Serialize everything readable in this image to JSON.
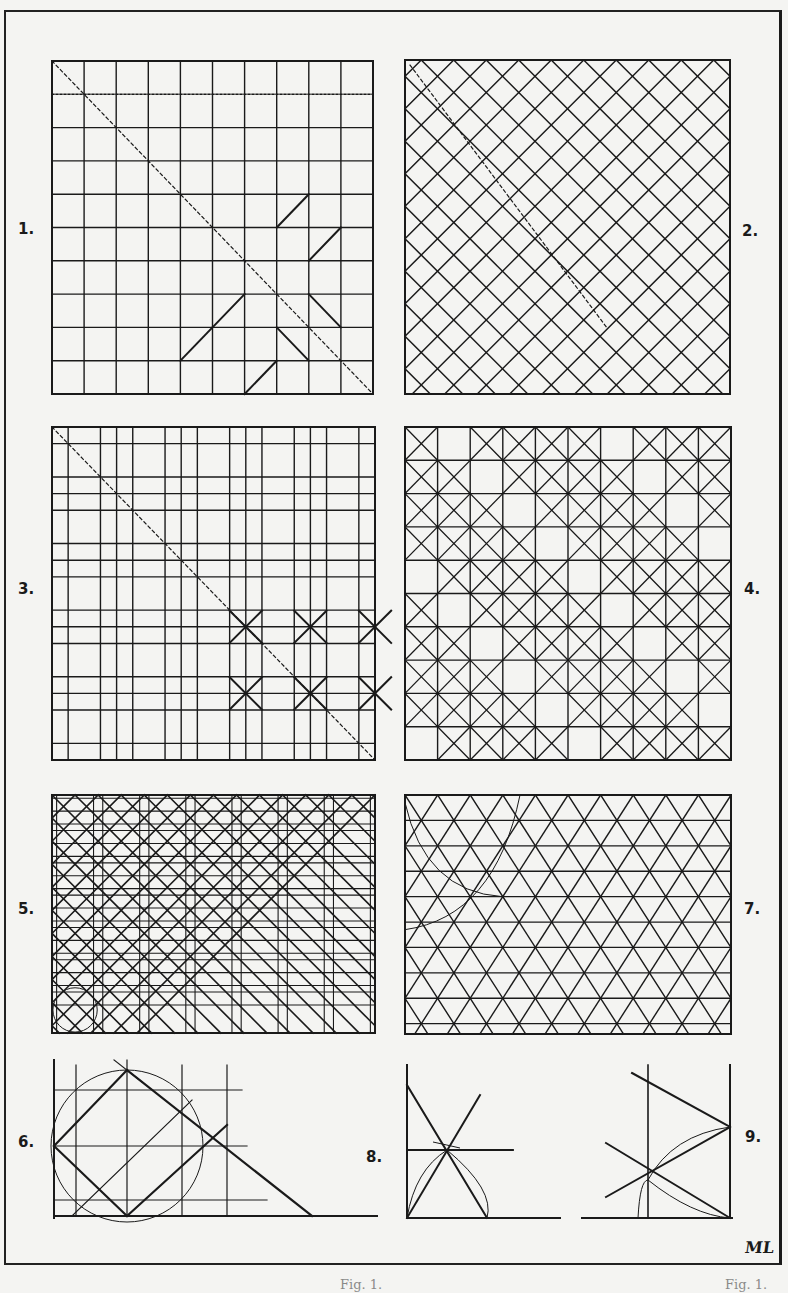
{
  "plate": {
    "monogram": "ML",
    "caption_fragments": [
      "Fig. 1.",
      "Fig. 1."
    ],
    "ink_color": "#1a1a1a",
    "paper_color": "#f4f4f2"
  },
  "figures": [
    {
      "id": 1,
      "label": "1.",
      "kind": "square-grid-diagonal",
      "box": [
        52,
        61,
        321,
        333
      ],
      "divisions": 10,
      "label_pos": [
        18,
        230
      ]
    },
    {
      "id": 2,
      "label": "2.",
      "kind": "diagonal-lattice",
      "box": [
        405,
        60,
        325,
        334
      ],
      "divisions": 10,
      "label_pos": [
        742,
        232
      ]
    },
    {
      "id": 3,
      "label": "3.",
      "kind": "paired-grid-octagons",
      "box": [
        52,
        427,
        323,
        333
      ],
      "divisions": 20,
      "label_pos": [
        18,
        590
      ]
    },
    {
      "id": 4,
      "label": "4.",
      "kind": "grid-with-crossed-squares",
      "box": [
        405,
        427,
        326,
        333
      ],
      "divisions": 10,
      "label_pos": [
        744,
        590
      ]
    },
    {
      "id": 5,
      "label": "5.",
      "kind": "octagon-lattice",
      "box": [
        52,
        795,
        323,
        238
      ],
      "divisions": 7,
      "label_pos": [
        18,
        910
      ]
    },
    {
      "id": 6,
      "label": "6.",
      "kind": "circle-square-construction",
      "box": [
        52,
        1060,
        325,
        158
      ],
      "label_pos": [
        18,
        1143
      ]
    },
    {
      "id": 7,
      "label": "7.",
      "kind": "triangular-lattice",
      "box": [
        405,
        795,
        326,
        239
      ],
      "divisions": 10,
      "label_pos": [
        744,
        910
      ]
    },
    {
      "id": 8,
      "label": "8.",
      "kind": "hexagonal-star-construction",
      "box": [
        405,
        1065,
        168,
        155
      ],
      "label_pos": [
        366,
        1158
      ]
    },
    {
      "id": 9,
      "label": "9.",
      "kind": "triangle-angle-construction",
      "box": [
        582,
        1065,
        150,
        155
      ],
      "label_pos": [
        745,
        1138
      ]
    }
  ]
}
